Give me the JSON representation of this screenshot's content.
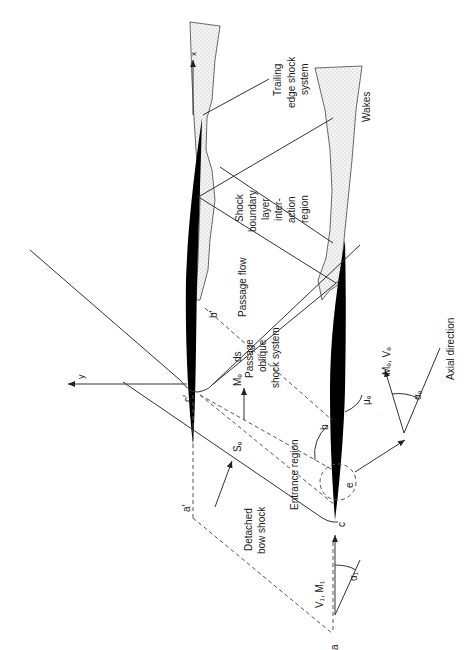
{
  "diagram": {
    "type": "supersonic compressor cascade flow schematic",
    "orientation": "rotated 90 degrees counter-clockwise (text reads bottom-to-top)",
    "colors": {
      "blade": "#000000",
      "lines": "#333333",
      "dashed_lines": "#555555",
      "wake_fill": "#e8e8e8",
      "background": "#ffffff"
    },
    "labels": {
      "trailing_edge_shock": [
        "Trailing",
        "edge shock",
        "system"
      ],
      "wakes": "Wakes",
      "shock_bl_interaction": [
        "Shock",
        "boundary",
        "layer",
        "inter-",
        "action",
        "region"
      ],
      "passage_flow": "Passage flow",
      "passage_oblique_shock": [
        "Passage",
        "oblique",
        "shock system"
      ],
      "entrance_region": "Entrance region",
      "detached_bow_shock": [
        "Detached",
        "bow shock"
      ],
      "axial_direction": "Axial direction",
      "exit_flow": "Mₑ, Vₑ",
      "inlet_flow": "V₁, M₁",
      "inlet_angle": "α₁",
      "exit_angle": "αₑ",
      "mach_angle": "μₑ",
      "me_ds": "Mₑ",
      "ds": "ds",
      "se": "Sₑ",
      "axis_x": "x",
      "axis_y": "y"
    },
    "points": {
      "a": "a",
      "a_prime": "a′",
      "b": "b",
      "b_prime": "b′",
      "c": "c",
      "c_prime": "c′",
      "e": "e"
    },
    "caption": "Fig. (caption text too faint to read)"
  }
}
